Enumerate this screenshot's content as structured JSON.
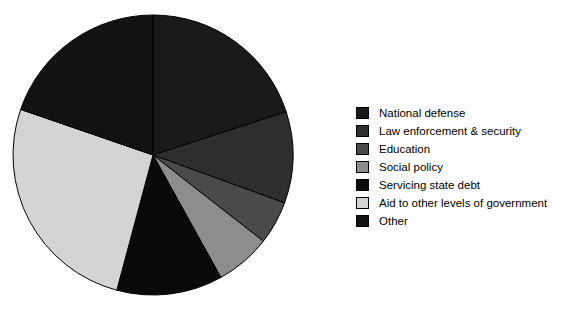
{
  "chart_data": {
    "type": "pie",
    "title": "",
    "subtitle": "",
    "xlabel": "",
    "ylabel": "",
    "legend_position": "right",
    "grid": false,
    "start_angle_deg": 0,
    "direction": "clockwise",
    "center": {
      "cx": 145,
      "cy": 147
    },
    "radius": 140,
    "categories": [
      "National defense",
      "Law enforcement & security",
      "Education",
      "Social policy",
      "Servicing state debt",
      "Aid to other levels of government",
      "Other"
    ],
    "values": [
      20,
      10.5,
      5,
      6.5,
      12,
      26,
      20
    ],
    "slices": [
      {
        "label": "National defense",
        "value": 20,
        "color": "#1a1a1a",
        "start_deg": 0,
        "end_deg": 72
      },
      {
        "label": "Law enforcement & security",
        "value": 10.5,
        "color": "#2e2e2e",
        "start_deg": 72,
        "end_deg": 110
      },
      {
        "label": "Education",
        "value": 5,
        "color": "#4a4a4a",
        "start_deg": 110,
        "end_deg": 128
      },
      {
        "label": "Social policy",
        "value": 6.5,
        "color": "#8d8d8d",
        "start_deg": 128,
        "end_deg": 151
      },
      {
        "label": "Servicing state debt",
        "value": 12,
        "color": "#0a0a0a",
        "start_deg": 151,
        "end_deg": 195
      },
      {
        "label": "Aid to other levels of government",
        "value": 26,
        "color": "#d4d4d4",
        "start_deg": 195,
        "end_deg": 289
      },
      {
        "label": "Other",
        "value": 20,
        "color": "#121212",
        "start_deg": 289,
        "end_deg": 360
      }
    ],
    "slice_outline_color": "#000000"
  },
  "legend": {
    "items": [
      {
        "label": "National defense",
        "color": "#1a1a1a"
      },
      {
        "label": "Law enforcement & security",
        "color": "#2e2e2e"
      },
      {
        "label": "Education",
        "color": "#4a4a4a"
      },
      {
        "label": "Social policy",
        "color": "#8d8d8d"
      },
      {
        "label": "Servicing state debt",
        "color": "#0a0a0a"
      },
      {
        "label": "Aid to other levels of government",
        "color": "#d4d4d4"
      },
      {
        "label": "Other",
        "color": "#121212"
      }
    ]
  },
  "figure": {
    "background": "#ffffff",
    "text_color": "#000000"
  }
}
